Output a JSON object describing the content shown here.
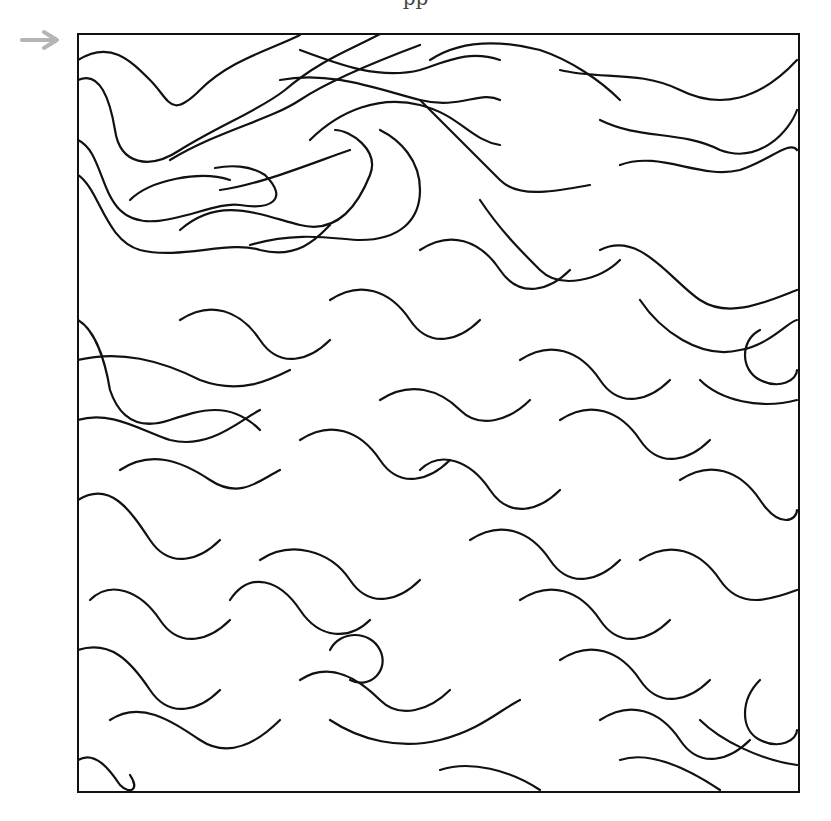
{
  "caption": {
    "text": "pp"
  },
  "arrow": {
    "label": "entry-arrow",
    "color": "#b5b5b5"
  },
  "maze": {
    "frame": {
      "x": 78,
      "y": 34,
      "width": 721,
      "height": 758,
      "stroke": "#111111",
      "stroke_width": 2
    },
    "line_color": "#111111",
    "line_width": 2.2,
    "paths": [
      "M78 60 C110 40 130 60 150 80 C170 100 170 120 200 90 C230 60 270 50 300 35",
      "M78 80 C100 70 110 100 115 130 C120 165 150 170 180 150 C220 125 260 110 285 90 C320 60 350 50 380 34",
      "M78 140 C100 150 100 190 120 210 C150 240 210 200 240 205 C270 210 290 200 265 175 C250 165 230 165 215 168",
      "M78 175 C100 190 105 240 140 250 C180 260 230 240 260 250 C300 260 320 235 330 225",
      "M130 200 C150 180 200 170 230 180",
      "M180 230 C220 195 260 215 300 225 C340 235 360 200 370 175 C380 150 350 130 335 130",
      "M250 245 C300 230 340 240 360 240 C400 240 420 220 420 190 C420 160 400 140 380 130",
      "M220 190 C260 185 320 160 350 150",
      "M78 320 C95 330 105 360 110 390 C120 420 140 430 170 420 C200 410 230 400 260 430",
      "M78 360 C120 350 160 360 200 380 C240 395 270 380 290 370",
      "M170 160 C220 130 270 120 300 100 C330 80 380 60 420 45",
      "M300 50 C340 65 380 80 420 70 C450 60 470 50 500 60",
      "M280 80 C330 70 380 90 420 100 C460 110 480 90 500 100",
      "M310 140 C340 110 380 95 420 105 C460 115 470 140 500 145",
      "M430 60 C460 40 500 40 540 50 C570 60 600 80 620 100",
      "M420 100 C450 130 480 160 500 180 C520 200 560 190 590 185",
      "M560 70 C600 80 640 70 680 90 C720 110 760 100 797 60",
      "M600 120 C640 140 680 130 720 150 C760 165 790 130 797 110",
      "M620 165 C660 150 700 180 740 170 C770 160 790 140 797 150",
      "M480 200 C500 230 520 250 540 270 C560 290 600 280 620 260",
      "M600 250 C640 230 670 280 700 300 C730 320 770 300 797 290",
      "M640 300 C660 330 700 360 740 350 C770 345 790 320 797 320",
      "M760 330 C740 340 740 370 760 380 C780 390 797 380 797 370",
      "M700 380 C720 400 760 410 797 400",
      "M78 420 C110 410 140 430 170 440 C210 450 240 420 260 410",
      "M120 470 C150 450 180 460 210 480 C240 500 260 480 280 470",
      "M78 500 C110 480 130 510 150 540 C170 570 200 560 220 540",
      "M90 600 C110 580 140 590 160 620 C180 650 210 640 230 620",
      "M78 650 C110 640 130 660 150 690 C170 720 200 710 220 690",
      "M110 720 C140 700 170 720 200 740 C230 760 260 740 280 720",
      "M78 760 C95 750 110 770 120 785 C130 795 140 790 130 775",
      "M230 600 C250 570 280 580 300 610 C320 640 350 640 370 620",
      "M300 680 C330 660 360 680 380 700 C400 720 430 710 450 690",
      "M330 650 C340 630 370 630 380 650 C390 670 370 690 350 680",
      "M330 720 C360 740 400 750 440 740 C480 730 500 710 520 700",
      "M260 560 C290 540 330 550 350 580 C370 610 400 600 420 580",
      "M300 440 C330 420 360 430 380 460 C400 490 430 480 450 460",
      "M380 400 C410 380 440 390 460 410 C480 430 510 420 530 400",
      "M420 470 C440 450 470 460 490 490 C510 520 540 510 560 490",
      "M470 540 C500 520 530 530 550 560 C570 590 600 580 620 560",
      "M520 600 C550 580 580 590 600 620 C620 650 650 640 670 620",
      "M560 660 C590 640 620 650 640 680 C660 710 690 700 710 680",
      "M600 720 C630 700 660 710 680 740 C700 770 730 760 750 740",
      "M640 560 C670 540 700 550 720 580 C740 610 770 600 797 590",
      "M680 480 C710 460 740 470 760 500 C780 530 797 520 797 510",
      "M560 420 C590 400 620 410 640 440 C660 470 690 460 710 440",
      "M520 360 C550 340 580 350 600 380 C620 410 650 400 670 380",
      "M760 680 C740 700 740 730 760 740 C780 750 797 740 797 730",
      "M620 760 C650 750 690 770 720 790",
      "M440 770 C470 760 510 770 540 790",
      "M700 720 C720 740 760 760 797 765",
      "M180 320 C210 300 240 310 260 340 C280 370 310 360 330 340",
      "M330 300 C360 280 390 290 410 320 C430 350 460 340 480 320",
      "M420 250 C450 230 480 240 500 270 C520 300 550 290 570 270"
    ]
  }
}
